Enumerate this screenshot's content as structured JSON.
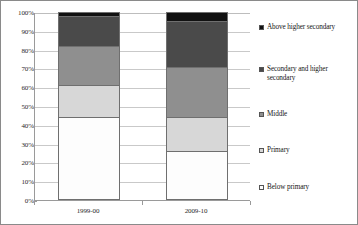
{
  "chart_data": {
    "type": "bar",
    "subtype": "stacked-100-percent",
    "title": "",
    "xlabel": "",
    "ylabel": "",
    "categories": [
      "1999-00",
      "2009-10"
    ],
    "ylim": [
      0,
      100
    ],
    "yticks": [
      "0%",
      "10%",
      "20%",
      "30%",
      "40%",
      "50%",
      "60%",
      "70%",
      "80%",
      "90%",
      "100%"
    ],
    "ytick_values": [
      0,
      10,
      20,
      30,
      40,
      50,
      60,
      70,
      80,
      90,
      100
    ],
    "grid": true,
    "legend_position": "right",
    "value_unit": "percent",
    "series": [
      {
        "name": "Below primary",
        "color": "#fdfdfd",
        "values": [
          44,
          26
        ]
      },
      {
        "name": "Primary",
        "color": "#d7d7d7",
        "values": [
          17,
          18
        ]
      },
      {
        "name": "Middle",
        "color": "#8f8f8f",
        "values": [
          21,
          27
        ]
      },
      {
        "name": "Secondary and higher secondary",
        "color": "#4a4a4a",
        "values": [
          16,
          24
        ]
      },
      {
        "name": "Above higher secondary",
        "color": "#111111",
        "values": [
          2,
          5
        ]
      }
    ]
  },
  "legend": {
    "items": [
      {
        "label": "Above higher secondary",
        "swatch": "#111111"
      },
      {
        "label": "Secondary and higher secondary",
        "swatch": "#4a4a4a"
      },
      {
        "label": "Middle",
        "swatch": "#8f8f8f"
      },
      {
        "label": "Primary",
        "swatch": "#d7d7d7"
      },
      {
        "label": "Below primary",
        "swatch": "#fdfdfd"
      }
    ]
  }
}
